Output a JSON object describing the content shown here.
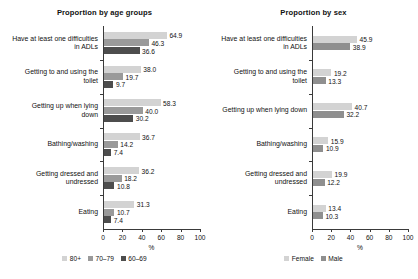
{
  "chart_data": [
    {
      "type": "bar",
      "orientation": "horizontal",
      "title": "Proportion by age groups",
      "xlabel": "%",
      "ylabel": "",
      "xlim": [
        0,
        100
      ],
      "xticks": [
        0,
        20,
        40,
        60,
        80,
        100
      ],
      "xtick_labels": [
        "0",
        "20",
        "40",
        "60",
        "80",
        "100"
      ],
      "grid": false,
      "legend_position": "bottom-center",
      "categories": [
        "Have at least one difficulties\nin ADLs",
        "Getting to and using the\ntoilet",
        "Getting up when lying\ndown",
        "Bathing/washing",
        "Getting dressed and\nundressed",
        "Eating"
      ],
      "series": [
        {
          "name": "80+",
          "color": "#d3d3d3",
          "values": [
            64.9,
            38.0,
            58.3,
            36.7,
            36.2,
            31.3
          ],
          "labels": [
            "64.9",
            "38.0",
            "58.3",
            "36.7",
            "36.2",
            "31.3"
          ]
        },
        {
          "name": "70–79",
          "color": "#9a9a9a",
          "values": [
            46.3,
            19.7,
            40.0,
            14.2,
            18.2,
            10.7
          ],
          "labels": [
            "46.3",
            "19.7",
            "40.0",
            "14.2",
            "18.2",
            "10.7"
          ]
        },
        {
          "name": "60–69",
          "color": "#4d4d4d",
          "values": [
            36.6,
            9.7,
            30.2,
            7.4,
            10.8,
            7.4
          ],
          "labels": [
            "36.6",
            "9.7",
            "30.2",
            "7.4",
            "10.8",
            "7.4"
          ]
        }
      ]
    },
    {
      "type": "bar",
      "orientation": "horizontal",
      "title": "Proportion by sex",
      "xlabel": "%",
      "ylabel": "",
      "xlim": [
        0,
        100
      ],
      "xticks": [
        0,
        20,
        40,
        60,
        80,
        100
      ],
      "xtick_labels": [
        "0",
        "20",
        "40",
        "60",
        "80",
        "100"
      ],
      "grid": false,
      "legend_position": "bottom-center",
      "categories": [
        "Have at least one difficulties\nin ADLs",
        "Getting to and using the\ntoilet",
        "Getting up when lying down",
        "Bathing/washing",
        "Getting dressed and\nundressed",
        "Eating"
      ],
      "series": [
        {
          "name": "Female",
          "color": "#d3d3d3",
          "values": [
            45.9,
            19.2,
            40.7,
            15.9,
            19.9,
            13.4
          ],
          "labels": [
            "45.9",
            "19.2",
            "40.7",
            "15.9",
            "19.9",
            "13.4"
          ]
        },
        {
          "name": "Male",
          "color": "#8f8f8f",
          "values": [
            38.9,
            13.3,
            32.2,
            10.9,
            12.2,
            10.3
          ],
          "labels": [
            "38.9",
            "13.3",
            "32.2",
            "10.9",
            "12.2",
            "10.3"
          ]
        }
      ]
    }
  ]
}
